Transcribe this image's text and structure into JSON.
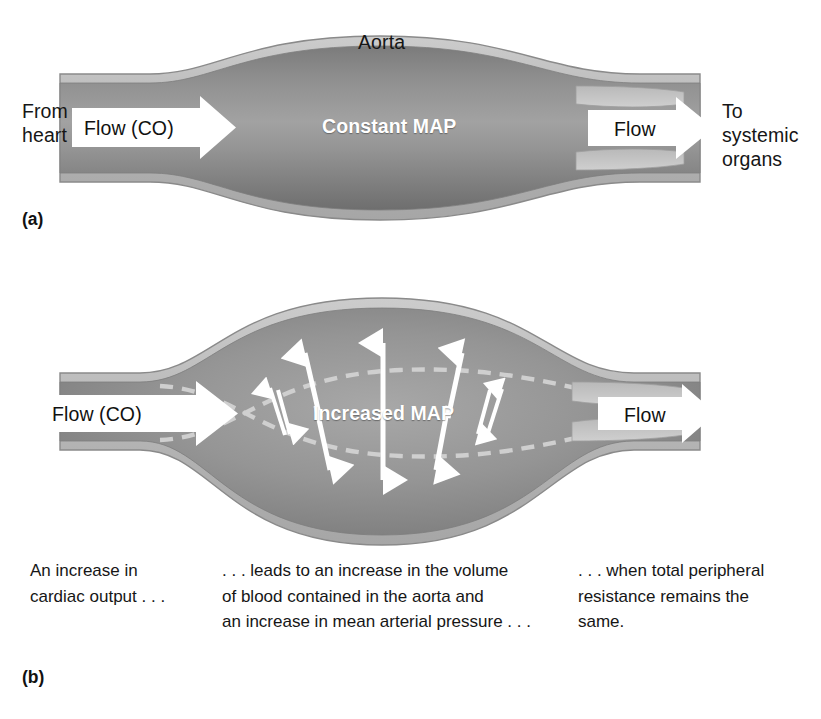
{
  "figure": {
    "panels": [
      {
        "letter": "(a)",
        "name": "baseline",
        "vessel_label": "Aorta",
        "inlet_label": "From\nheart",
        "outlet_label": "To\nsystemic\norgans",
        "inlet_arrow_label": "Flow (CO)",
        "outlet_arrow_label": "Flow",
        "center_label": "Constant MAP"
      },
      {
        "letter": "(b)",
        "name": "increased-cardiac-output",
        "vessel_label": "",
        "inlet_label": "",
        "outlet_label": "",
        "inlet_arrow_label": "Flow (CO)",
        "outlet_arrow_label": "Flow",
        "center_label": "Increased MAP"
      }
    ]
  },
  "caption": {
    "columns": [
      "An increase in\ncardiac output . . .",
      ". . . leads to an increase in the volume\nof blood contained in the aorta and\nan increase in mean arterial pressure . . .",
      ". . . when total peripheral\nresistance remains the\nsame."
    ]
  },
  "colors": {
    "background": "#ffffff",
    "vessel_wall_light": "#c3c3c3",
    "vessel_wall_outline": "#8d8d8d",
    "lumen_dark": "#6f6f6f",
    "lumen_mid": "#8d8d8d",
    "lumen_light": "#a5a5a5",
    "leaflet_light": "#b9b9b9",
    "arrow_white": "#ffffff",
    "text_dark": "#161616",
    "text_white": "#ffffff",
    "dashed_line": "#c9c9c9"
  },
  "annotations": {
    "pressure_arrows_top_count": 5,
    "pressure_arrows_bottom_count": 5,
    "dashed_baseline_present": true,
    "dashed_baseline_meaning": "original (pre-distension) aortic wall position"
  }
}
